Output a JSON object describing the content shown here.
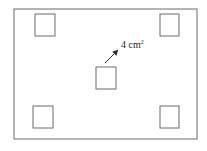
{
  "diagram": {
    "outer_rect": {
      "x": 14,
      "y": 9,
      "w": 183,
      "h": 130
    },
    "squares": [
      {
        "name": "top-left",
        "x": 35,
        "y": 14,
        "size": 20
      },
      {
        "name": "top-right",
        "x": 160,
        "y": 14,
        "size": 19
      },
      {
        "name": "center",
        "x": 96,
        "y": 67,
        "size": 20
      },
      {
        "name": "bottom-left",
        "x": 33,
        "y": 106,
        "size": 20
      },
      {
        "name": "bottom-right",
        "x": 160,
        "y": 106,
        "size": 19
      }
    ],
    "annotation": {
      "value": "4",
      "unit": "cm",
      "exponent": "2"
    },
    "stroke_color": "#6b6b6b"
  }
}
